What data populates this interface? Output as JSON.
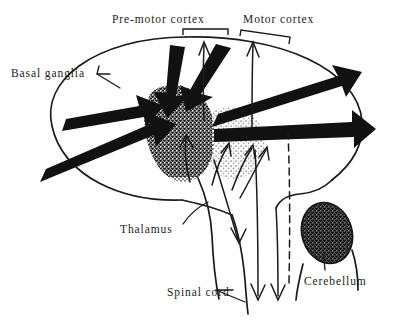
{
  "figure": {
    "width": 407,
    "height": 323,
    "background_color": "#ffffff",
    "ink_color": "#1a1a1a"
  },
  "labels": {
    "premotor_cortex": "Pre-motor  cortex",
    "motor_cortex": "Motor  cortex",
    "basal_ganglia": "Basal  ganglia",
    "thalamus": "Thalamus",
    "spinal_cord": "Spinal cord",
    "cerebellum": "Cerebellum"
  },
  "structures": [
    {
      "name": "brain-outline",
      "description": "large oval cerebrum outline",
      "fill": "none",
      "stroke": "#1a1a1a"
    },
    {
      "name": "basal-ganglia-mass",
      "description": "dark stippled irregular blob, left of centre",
      "shade": "dark-stipple"
    },
    {
      "name": "thalamus-mass",
      "description": "light grey stippled rounded mass, right of basal ganglia",
      "shade": "light-stipple"
    },
    {
      "name": "cerebellum-mass",
      "description": "dark stippled ellipse at lower right inside its own outline",
      "shade": "dark-stipple"
    }
  ],
  "connectors": {
    "thick_arrows": "heavy black tapered arrows converging on the basal ganglia from the cortex above and from the left, plus two heavy bars running right across the hemisphere",
    "thin_arrows": "fine curved arrows ascending from thalamus to cortex and descending toward the spinal cord",
    "descending_arrowheads": 3
  },
  "brackets": [
    {
      "name": "premotor-cortex-bracket"
    },
    {
      "name": "motor-cortex-bracket"
    }
  ],
  "leader_lines": [
    {
      "name": "basal-ganglia-leader"
    },
    {
      "name": "thalamus-leader"
    },
    {
      "name": "spinal-cord-leader"
    },
    {
      "name": "cerebellum-leader"
    }
  ]
}
